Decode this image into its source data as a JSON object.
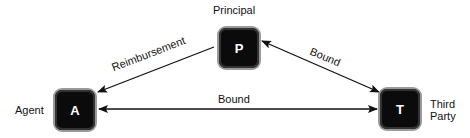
{
  "nodes": {
    "principal": {
      "letter": "P",
      "label": "Principal"
    },
    "agent": {
      "letter": "A",
      "label": "Agent"
    },
    "third_party": {
      "letter": "T",
      "label_line1": "Third",
      "label_line2": "Party"
    }
  },
  "edges": {
    "principal_to_agent": {
      "label": "Reimbursement",
      "direction": "P→A"
    },
    "principal_third_party": {
      "label": "Bound",
      "direction": "bidirectional"
    },
    "agent_third_party": {
      "label": "Bound",
      "direction": "bidirectional"
    }
  }
}
